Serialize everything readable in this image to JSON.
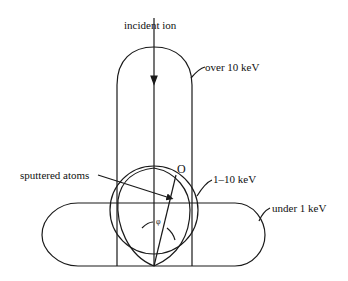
{
  "diagram": {
    "labels": {
      "incident_ion": "incident ion",
      "over_10kev": "over 10 keV",
      "one_to_ten_kev": "1–10 keV",
      "under_1kev": "under 1 keV",
      "sputtered_atoms": "sputtered atoms",
      "point_o": "O",
      "angle_phi": "φ"
    },
    "colors": {
      "stroke": "#1a1a1a",
      "background": "#ffffff"
    }
  }
}
